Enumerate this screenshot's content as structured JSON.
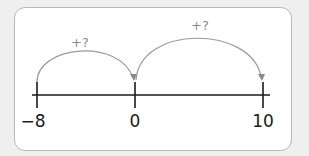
{
  "diagram": {
    "type": "number-line",
    "ticks": [
      {
        "value": -8,
        "label": "−8",
        "x": 37
      },
      {
        "value": 0,
        "label": "0",
        "x": 135
      },
      {
        "value": 10,
        "label": "10",
        "x": 263
      }
    ],
    "jumps": [
      {
        "from": -8,
        "to": 0,
        "label": "+?"
      },
      {
        "from": 0,
        "to": 10,
        "label": "+?"
      }
    ],
    "colors": {
      "axis": "#1a1a1a",
      "arc": "#9a9a9a",
      "card_border": "#b9b9b9",
      "background": "#efefef"
    }
  }
}
